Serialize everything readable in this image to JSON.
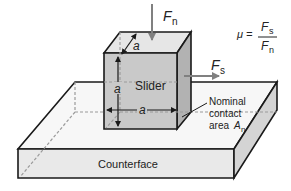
{
  "diagram": {
    "slider_label": "Slider",
    "counterface_label": "Counterface",
    "dimension_label": "a",
    "normal_force": {
      "symbol": "F",
      "subscript": "n"
    },
    "shear_force": {
      "symbol": "F",
      "subscript": "s"
    },
    "contact_area": {
      "line1": "Nominal",
      "line2": "contact",
      "line3": "area ",
      "symbol": "A",
      "subscript": "n"
    },
    "formula": {
      "lhs": "μ =",
      "num_symbol": "F",
      "num_sub": "s",
      "den_symbol": "F",
      "den_sub": "n"
    },
    "colors": {
      "outline": "#1a1a1a",
      "slider_front": "#c9c9c9",
      "slider_side": "#b2b2b2",
      "slider_top": "#e6e6e6",
      "slab_top": "#f7f7f7",
      "slab_front": "#e9e9e9",
      "slab_side": "#d4d4d4",
      "arrow": "#808080",
      "dashed": "#9a9a9a"
    }
  }
}
